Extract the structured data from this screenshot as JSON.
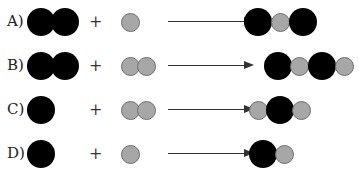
{
  "options": [
    {
      "label": "A)",
      "reactant1": "two black atoms (diatomic)",
      "plus": "+",
      "reactant2": "one gray atom",
      "product": "black-gray-black"
    },
    {
      "label": "B)",
      "reactant1": "two black atoms (diatomic)",
      "plus": "+",
      "reactant2": "two gray atoms (diatomic)",
      "product": "black-gray-black-gray"
    },
    {
      "label": "C)",
      "reactant1": "one black atom",
      "plus": "+",
      "reactant2": "two gray atoms (diatomic)",
      "product": "gray-black-gray"
    },
    {
      "label": "D)",
      "reactant1": "one black atom",
      "plus": "+",
      "reactant2": "one gray atom",
      "product": "black-gray"
    }
  ],
  "colors": {
    "large_atom": "#000000",
    "small_atom": "#a7a7a7",
    "small_atom_border": "#6e6e6e",
    "arrow": "#333333"
  }
}
